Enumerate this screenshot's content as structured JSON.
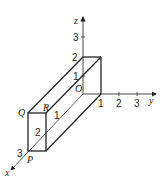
{
  "diagram": {
    "type": "3d-coordinate-box",
    "axes": {
      "x": {
        "label": "x",
        "ticks": [
          "1",
          "2",
          "3"
        ]
      },
      "y": {
        "label": "y",
        "ticks": [
          "1",
          "2",
          "3"
        ]
      },
      "z": {
        "label": "z",
        "ticks": [
          "1",
          "2",
          "3"
        ]
      }
    },
    "points": {
      "origin": "O",
      "P": "P",
      "Q": "Q",
      "R": "R"
    },
    "colors": {
      "line": "#222222",
      "axis": "#333333"
    }
  }
}
